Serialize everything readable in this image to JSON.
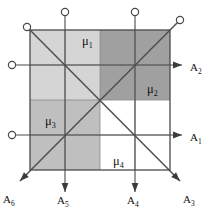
{
  "figure": {
    "background_color": "#ffffff",
    "line_color": "#4a4a4a",
    "grid_color": "#8c8c8c"
  },
  "square": {
    "x": 30,
    "y": 30,
    "size": 140,
    "divisions": 4,
    "cell_size": 35,
    "border_color": "#4a4a4a"
  },
  "shades": {
    "light": "#d5d5d5",
    "medium": "#bfbfbf",
    "dark": "#a0a0a0",
    "white": "#ffffff"
  },
  "cells": [
    {
      "row": 0,
      "col": 0,
      "shade": "light"
    },
    {
      "row": 0,
      "col": 1,
      "shade": "light"
    },
    {
      "row": 0,
      "col": 2,
      "shade": "dark"
    },
    {
      "row": 0,
      "col": 3,
      "shade": "dark"
    },
    {
      "row": 1,
      "col": 0,
      "shade": "light"
    },
    {
      "row": 1,
      "col": 1,
      "shade": "light"
    },
    {
      "row": 1,
      "col": 2,
      "shade": "dark"
    },
    {
      "row": 1,
      "col": 3,
      "shade": "dark"
    },
    {
      "row": 2,
      "col": 0,
      "shade": "medium"
    },
    {
      "row": 2,
      "col": 1,
      "shade": "medium"
    },
    {
      "row": 2,
      "col": 2,
      "shade": "white"
    },
    {
      "row": 2,
      "col": 3,
      "shade": "white"
    },
    {
      "row": 3,
      "col": 0,
      "shade": "medium"
    },
    {
      "row": 3,
      "col": 1,
      "shade": "medium"
    },
    {
      "row": 3,
      "col": 2,
      "shade": "white"
    },
    {
      "row": 3,
      "col": 3,
      "shade": "white"
    }
  ],
  "mu_labels": [
    {
      "id": "mu1",
      "base": "μ",
      "sub": "1",
      "x": 82,
      "y": 45
    },
    {
      "id": "mu2",
      "base": "μ",
      "sub": "2",
      "x": 147,
      "y": 93
    },
    {
      "id": "mu3",
      "base": "μ",
      "sub": "3",
      "x": 45,
      "y": 125
    },
    {
      "id": "mu4",
      "base": "μ",
      "sub": "4",
      "x": 113,
      "y": 165
    }
  ],
  "axes": [
    {
      "id": "A1",
      "base": "A",
      "sub": "1",
      "direction": "right",
      "label_x": 190,
      "label_y": 141,
      "start": {
        "x": 12,
        "y": 135
      },
      "end": {
        "x": 182,
        "y": 135
      },
      "node": {
        "x": 12,
        "y": 135
      }
    },
    {
      "id": "A2",
      "base": "A",
      "sub": "2",
      "direction": "right",
      "label_x": 190,
      "label_y": 71,
      "start": {
        "x": 12,
        "y": 65
      },
      "end": {
        "x": 182,
        "y": 65
      },
      "node": {
        "x": 12,
        "y": 65
      }
    },
    {
      "id": "A3",
      "base": "A",
      "sub": "3",
      "direction": "down-right",
      "label_x": 183,
      "label_y": 203,
      "start": {
        "x": 27,
        "y": 27
      },
      "end": {
        "x": 180,
        "y": 181
      },
      "node": {
        "x": 27,
        "y": 27
      }
    },
    {
      "id": "A4",
      "base": "A",
      "sub": "4",
      "direction": "down",
      "label_x": 127,
      "label_y": 204,
      "start": {
        "x": 135,
        "y": 12
      },
      "end": {
        "x": 135,
        "y": 192
      },
      "node": {
        "x": 135,
        "y": 12
      }
    },
    {
      "id": "A5",
      "base": "A",
      "sub": "5",
      "direction": "down",
      "label_x": 57,
      "label_y": 204,
      "start": {
        "x": 65,
        "y": 12
      },
      "end": {
        "x": 65,
        "y": 192
      },
      "node": {
        "x": 65,
        "y": 12
      }
    },
    {
      "id": "A6",
      "base": "A",
      "sub": "6",
      "direction": "down-left",
      "label_x": 3,
      "label_y": 203,
      "start": {
        "x": 180,
        "y": 20
      },
      "end": {
        "x": 20,
        "y": 181
      },
      "node": {
        "x": 180,
        "y": 20
      }
    }
  ]
}
